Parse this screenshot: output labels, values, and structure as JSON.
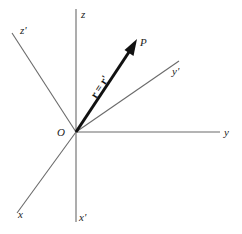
{
  "diagram": {
    "origin_label": "O",
    "point_label": "P",
    "vector_label": "r = r'",
    "axes": {
      "unprimed": {
        "x": "x",
        "y": "y",
        "z": "z"
      },
      "primed": {
        "x": "x'",
        "y": "y'",
        "z": "z'"
      }
    },
    "colors": {
      "axis": "#6a6a6a",
      "vector": "#111111",
      "text": "#222222",
      "background": "#ffffff"
    }
  }
}
